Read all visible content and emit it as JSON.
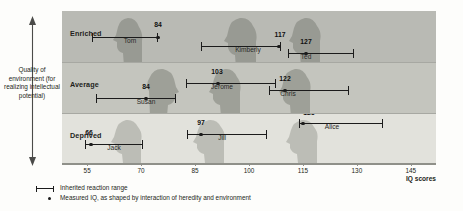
{
  "figure": {
    "y_axis_label": "Quality of environment (for realizing intellectual potential)",
    "x_axis_title": "IQ scores"
  },
  "legend": {
    "range_label": "Inherited reaction range",
    "measured_label": "Measured IQ, as shaped by interaction of heredity and environment"
  },
  "bands": [
    {
      "label": "Enriched",
      "color": "#b9bab4"
    },
    {
      "label": "Average",
      "color": "#c4c5be"
    },
    {
      "label": "Deprived",
      "color": "#e2e2dc"
    }
  ],
  "chart_data": {
    "type": "range",
    "xlabel": "IQ scores",
    "ylabel": "Quality of environment (for realizing intellectual potential)",
    "xlim": [
      48,
      152
    ],
    "ticks": [
      55,
      70,
      85,
      100,
      115,
      130,
      145
    ],
    "grid": false,
    "legend": "below-axis",
    "categories": [
      "Enriched",
      "Average",
      "Deprived"
    ],
    "series": [
      {
        "name": "Enriched",
        "points": [
          {
            "name": "Tom",
            "measured": 84,
            "range_low": 68,
            "range_high": 86
          },
          {
            "name": "Kimberly",
            "measured": 117,
            "range_low": 98,
            "range_high": 119
          },
          {
            "name": "Ted",
            "measured": 127,
            "range_low": 122,
            "range_high": 140
          }
        ]
      },
      {
        "name": "Average",
        "points": [
          {
            "name": "Susan",
            "measured": 84,
            "range_low": 70,
            "range_high": 90
          },
          {
            "name": "Jerome",
            "measured": 103,
            "range_low": 95,
            "range_high": 118
          },
          {
            "name": "Chris",
            "measured": 122,
            "range_low": 118,
            "range_high": 140
          }
        ]
      },
      {
        "name": "Deprived",
        "points": [
          {
            "name": "Jack",
            "measured": 66,
            "range_low": 64,
            "range_high": 85
          },
          {
            "name": "Jill",
            "measured": 97,
            "range_low": 93,
            "range_high": 115
          },
          {
            "name": "Alice",
            "measured": 125,
            "range_low": 124,
            "range_high": 147
          }
        ]
      }
    ]
  }
}
